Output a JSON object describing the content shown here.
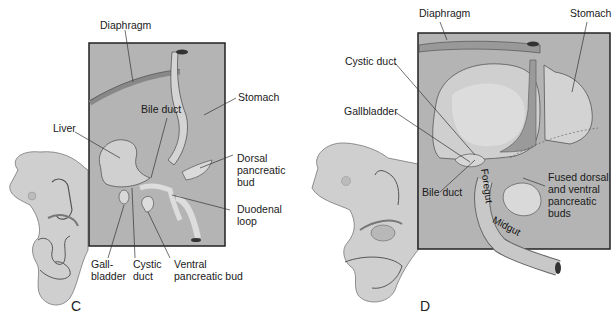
{
  "figure": {
    "panels": [
      {
        "id": "C",
        "letter": "C",
        "labels": {
          "diaphragm": "Diaphragm",
          "stomach": "Stomach",
          "bile_duct": "Bile duct",
          "liver": "Liver",
          "dorsal_bud_1": "Dorsal",
          "dorsal_bud_2": "pancreatic",
          "dorsal_bud_3": "bud",
          "duodenal_1": "Duodenal",
          "duodenal_2": "loop",
          "gall_1": "Gall-",
          "gall_2": "bladder",
          "cystic_1": "Cystic",
          "cystic_2": "duct",
          "ventral_1": "Ventral",
          "ventral_2": "pancreatic bud"
        }
      },
      {
        "id": "D",
        "letter": "D",
        "labels": {
          "diaphragm": "Diaphragm",
          "stomach": "Stomach",
          "cystic_duct": "Cystic duct",
          "gallbladder": "Gallbladder",
          "bile_duct": "Bile duct",
          "foregut": "Foregut",
          "midgut": "Midgut",
          "fused_1": "Fused dorsal",
          "fused_2": "and ventral",
          "fused_3": "pancreatic",
          "fused_4": "buds"
        }
      }
    ],
    "colors": {
      "box_fill": "#b4b4b4",
      "embryo_fill": "#cfcfcf",
      "organ_light": "#d9d9d9",
      "organ_mid": "#a2a2a2",
      "outline": "#333333"
    }
  }
}
